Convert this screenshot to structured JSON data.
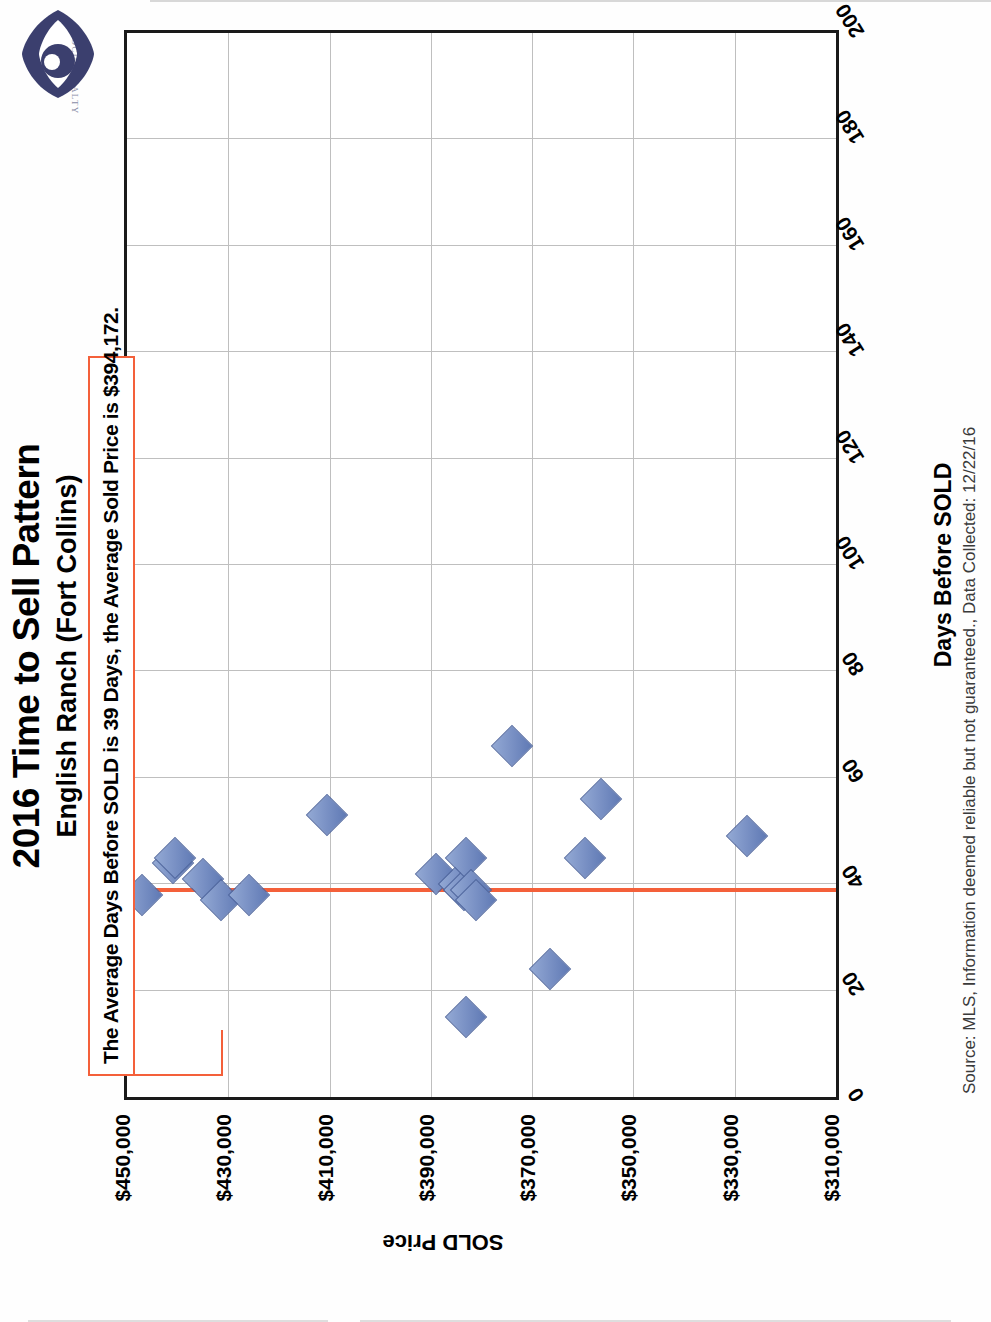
{
  "logo": {
    "wordmark": "FOCUS REALTY",
    "brand_color": "#3b3f6e",
    "icon": "eye-logo-icon"
  },
  "header": {
    "title": "2016 Time to Sell Pattern",
    "subtitle": "English Ranch (Fort Collins)"
  },
  "annotation": {
    "text": "The Average Days Before SOLD is 39 Days, the Average Sold Price is $394,172.",
    "border_color": "#f4603a"
  },
  "footer": {
    "source": "Source: MLS, Information deemed reliable but not guaranteed., Data Collected: 12/22/16"
  },
  "chart_data": {
    "type": "scatter",
    "title": "2016 Time to Sell Pattern",
    "subtitle": "English Ranch (Fort Collins)",
    "xlabel": "Days Before SOLD",
    "ylabel": "SOLD Price",
    "xlim": [
      0,
      200
    ],
    "ylim": [
      310000,
      450000
    ],
    "xticks": [
      0,
      20,
      40,
      60,
      80,
      100,
      120,
      140,
      160,
      180,
      200
    ],
    "xtick_labels": [
      "0",
      "20",
      "40",
      "60",
      "80",
      "100",
      "120",
      "140",
      "160",
      "180",
      "200"
    ],
    "yticks": [
      310000,
      330000,
      350000,
      370000,
      390000,
      410000,
      430000,
      450000
    ],
    "ytick_labels": [
      "$310,000",
      "$330,000",
      "$350,000",
      "$370,000",
      "$390,000",
      "$410,000",
      "$430,000",
      "$450,000"
    ],
    "grid": "vertical-and-horizontal",
    "legend": "none",
    "marker": "blue-diamond",
    "marker_color": "#7c93c6",
    "reference_line": {
      "name": "Average Days Before SOLD",
      "orientation": "vertical",
      "value": 39,
      "color": "#f4603a",
      "label": "The Average Days Before SOLD is 39 Days, the Average Sold Price is $394,172."
    },
    "averages": {
      "days_before_sold": 39,
      "sold_price": 394172,
      "sold_price_label": "$394,172"
    },
    "points": [
      {
        "x": 38,
        "y": 447000
      },
      {
        "x": 44,
        "y": 441000
      },
      {
        "x": 45,
        "y": 440500
      },
      {
        "x": 41,
        "y": 435000
      },
      {
        "x": 37,
        "y": 431500
      },
      {
        "x": 38,
        "y": 426000
      },
      {
        "x": 53,
        "y": 410500
      },
      {
        "x": 42,
        "y": 389000
      },
      {
        "x": 40,
        "y": 384500
      },
      {
        "x": 39,
        "y": 383500
      },
      {
        "x": 45,
        "y": 383000
      },
      {
        "x": 39,
        "y": 382000
      },
      {
        "x": 37,
        "y": 381000
      },
      {
        "x": 15,
        "y": 383000
      },
      {
        "x": 66,
        "y": 374000
      },
      {
        "x": 24,
        "y": 366500
      },
      {
        "x": 45,
        "y": 359500
      },
      {
        "x": 56,
        "y": 356500
      },
      {
        "x": 49,
        "y": 327500
      }
    ]
  }
}
